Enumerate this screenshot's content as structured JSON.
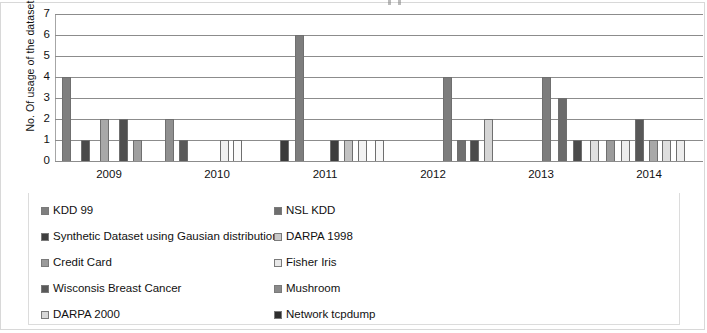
{
  "axes": {
    "y_title": "No. Of usage of the dataset",
    "y_ticks": [
      "0",
      "1",
      "2",
      "3",
      "4",
      "5",
      "6",
      "7"
    ],
    "x_ticks": [
      "2009",
      "2010",
      "2011",
      "2012",
      "2013",
      "2014"
    ]
  },
  "legend": {
    "items": [
      {
        "label": "KDD 99",
        "color": "#7f7f7f",
        "swatch_name": "legend-swatch-kdd-99"
      },
      {
        "label": "NSL KDD",
        "color": "#6e6e6e",
        "swatch_name": "legend-swatch-nsl-kdd"
      },
      {
        "label": "Synthetic Dataset using Gausian distribution",
        "color": "#3f3f3f",
        "swatch_name": "legend-swatch-synthetic-dataset"
      },
      {
        "label": "DARPA 1998",
        "color": "#c9c9c9",
        "swatch_name": "legend-swatch-darpa-1998"
      },
      {
        "label": "Credit Card",
        "color": "#9a9a9a",
        "swatch_name": "legend-swatch-credit-card"
      },
      {
        "label": "Fisher Iris",
        "color": "#e8e8e8",
        "swatch_name": "legend-swatch-fisher-iris"
      },
      {
        "label": "Wisconsis Breast Cancer",
        "color": "#595959",
        "swatch_name": "legend-swatch-wisconsis-breast-cancer"
      },
      {
        "label": "Mushroom",
        "color": "#8a8a8a",
        "swatch_name": "legend-swatch-mushroom"
      },
      {
        "label": "DARPA 2000",
        "color": "#d8d8d8",
        "swatch_name": "legend-swatch-darpa-2000"
      },
      {
        "label": "Network tcpdump",
        "color": "#2e2e2e",
        "swatch_name": "legend-swatch-network-tcpdump"
      }
    ]
  },
  "chart_data": {
    "type": "bar",
    "title": "",
    "xlabel": "",
    "ylabel": "No. Of usage of the dataset",
    "ylim": [
      0,
      7
    ],
    "yticks": [
      0,
      1,
      2,
      3,
      4,
      5,
      6,
      7
    ],
    "grid": true,
    "legend_position": "bottom",
    "categories": [
      "2009",
      "2010",
      "2011",
      "2012",
      "2013",
      "2014"
    ],
    "series": [
      {
        "name": "KDD 99",
        "color": "#7f7f7f",
        "values": [
          4,
          0,
          6,
          4,
          4,
          4
        ]
      },
      {
        "name": "NSL KDD",
        "color": "#6e6e6e",
        "values": [
          1,
          0,
          1,
          1,
          3,
          1
        ]
      },
      {
        "name": "Synthetic Dataset using Gausian distribution",
        "color": "#3f3f3f",
        "values": [
          0,
          0,
          1,
          1,
          1,
          0
        ]
      },
      {
        "name": "DARPA 1998",
        "color": "#c9c9c9",
        "values": [
          2,
          1,
          1,
          2,
          1,
          0
        ]
      },
      {
        "name": "Credit Card",
        "color": "#9a9a9a",
        "values": [
          0,
          0,
          0,
          0,
          1,
          0
        ]
      },
      {
        "name": "Fisher Iris",
        "color": "#e8e8e8",
        "values": [
          1,
          1,
          1,
          0,
          1,
          0
        ]
      },
      {
        "name": "Wisconsis Breast Cancer",
        "color": "#595959",
        "values": [
          2,
          0,
          0,
          0,
          2,
          0
        ]
      },
      {
        "name": "Mushroom",
        "color": "#8a8a8a",
        "values": [
          1,
          0,
          0,
          0,
          1,
          0
        ]
      },
      {
        "name": "DARPA 2000",
        "color": "#d8d8d8",
        "values": [
          0,
          0,
          0,
          0,
          1,
          0
        ]
      },
      {
        "name": "Network tcpdump",
        "color": "#2e2e2e",
        "values": [
          2,
          0,
          1,
          0,
          1,
          0
        ]
      }
    ],
    "bars": [
      {
        "x": 7,
        "h": 4,
        "color": "#7f7f7f",
        "series": "KDD 99"
      },
      {
        "x": 26,
        "h": 1,
        "color": "#4a4a4a",
        "series": "Network tcpdump"
      },
      {
        "x": 45,
        "h": 2,
        "color": "#a8a8a8",
        "series": "Credit Card"
      },
      {
        "x": 64,
        "h": 2,
        "color": "#4f4f4f",
        "series": "Wisconsis Breast Cancer"
      },
      {
        "x": 78,
        "h": 1,
        "color": "#a0a0a0",
        "series": "Mushroom"
      },
      {
        "x": 110,
        "h": 2,
        "color": "#8f8f8f",
        "series": "KDD 99"
      },
      {
        "x": 124,
        "h": 1,
        "color": "#5a5a5a",
        "series": "NSL KDD"
      },
      {
        "x": 165,
        "h": 1,
        "color": "#f0f0f0",
        "series": "Fisher Iris"
      },
      {
        "x": 178,
        "h": 1,
        "color": "#fbfbfb",
        "series": "DARPA 2000"
      },
      {
        "x": 225,
        "h": 1,
        "color": "#3a3a3a",
        "series": "Network tcpdump"
      },
      {
        "x": 240,
        "h": 6,
        "color": "#7d7d7d",
        "series": "KDD 99"
      },
      {
        "x": 275,
        "h": 1,
        "color": "#3d3d3d",
        "series": "Synthetic Dataset using Gausian distribution"
      },
      {
        "x": 289,
        "h": 1,
        "color": "#c2c2c2",
        "series": "DARPA 1998"
      },
      {
        "x": 303,
        "h": 1,
        "color": "#f2f2f2",
        "series": "Fisher Iris"
      },
      {
        "x": 320,
        "h": 1,
        "color": "#f7f7f7",
        "series": "DARPA 2000"
      },
      {
        "x": 388,
        "h": 4,
        "color": "#7d7d7d",
        "series": "KDD 99"
      },
      {
        "x": 402,
        "h": 1,
        "color": "#707070",
        "series": "NSL KDD"
      },
      {
        "x": 415,
        "h": 1,
        "color": "#4b4b4b",
        "series": "Synthetic Dataset"
      },
      {
        "x": 429,
        "h": 2,
        "color": "#d5d5d5",
        "series": "DARPA 1998"
      },
      {
        "x": 487,
        "h": 4,
        "color": "#7d7d7d",
        "series": "KDD 99"
      },
      {
        "x": 503,
        "h": 3,
        "color": "#6b6b6b",
        "series": "NSL KDD"
      },
      {
        "x": 518,
        "h": 1,
        "color": "#4b4b4b",
        "series": "Synthetic Dataset"
      },
      {
        "x": 535,
        "h": 1,
        "color": "#e0e0e0",
        "series": "Fisher Iris"
      },
      {
        "x": 551,
        "h": 1,
        "color": "#9b9b9b",
        "series": "Credit Card"
      },
      {
        "x": 566,
        "h": 1,
        "color": "#ededed",
        "series": "DARPA 2000"
      },
      {
        "x": 580,
        "h": 2,
        "color": "#585858",
        "series": "Wisconsis Breast Cancer"
      },
      {
        "x": 594,
        "h": 1,
        "color": "#a8a8a8",
        "series": "Mushroom"
      },
      {
        "x": 607,
        "h": 1,
        "color": "#dedede",
        "series": "DARPA 1998"
      },
      {
        "x": 621,
        "h": 1,
        "color": "#ededed",
        "series": "DARPA 2000"
      },
      {
        "x": 654,
        "h": 4,
        "color": "#7d7d7d",
        "series": "KDD 99"
      },
      {
        "x": 670,
        "h": 1,
        "color": "#6b6b6b",
        "series": "NSL KDD"
      }
    ]
  }
}
